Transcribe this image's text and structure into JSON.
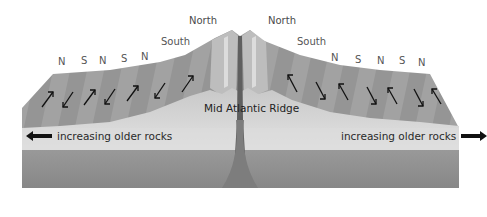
{
  "diagram": {
    "title": "Mid Atlantic Ridge",
    "peak_labels": {
      "left": "North",
      "right": "North"
    },
    "secondary_labels": {
      "left": "South",
      "right": "South"
    },
    "left_polarity": [
      "N",
      "S",
      "N",
      "S",
      "N"
    ],
    "right_polarity": [
      "N",
      "S",
      "N",
      "S",
      "N"
    ],
    "ridge_label": "Mid Atlantic Ridge",
    "older_rocks": {
      "left": "increasing older rocks",
      "right": "increasing older rocks"
    },
    "left_arrows": [
      "up",
      "down",
      "up",
      "down",
      "up",
      "down",
      "up"
    ],
    "right_arrows": [
      "up",
      "down",
      "up",
      "down",
      "up",
      "down",
      "up"
    ],
    "colors": {
      "crust_top": "#9a9a9a",
      "crust_band_light": "#acacac",
      "ridge_light": "#d4d4d4",
      "older_band": "#dcdcdc",
      "body": "#8e8e8e",
      "body_dark": "#7a7a7a",
      "arrow": "#111111",
      "label": "#555555"
    }
  }
}
